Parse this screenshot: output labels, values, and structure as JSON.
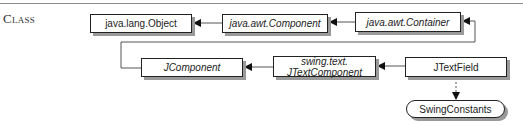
{
  "section_label": "Class",
  "classes": {
    "object": {
      "label": "java.lang.Object",
      "italic": false
    },
    "component": {
      "label": "java.awt.Component",
      "italic": true
    },
    "container": {
      "label": "java.awt.Container",
      "italic": true
    },
    "jcomponent": {
      "label": "JComponent",
      "italic": true
    },
    "jtextcomponent": {
      "line1": "swing.text.",
      "line2": "JTextComponent",
      "italic": true
    },
    "jtextfield": {
      "label": "JTextField",
      "italic": false
    },
    "swingconstants": {
      "label": "SwingConstants",
      "kind": "interface"
    }
  },
  "relations": [
    {
      "from": "java.awt.Component",
      "to": "java.lang.Object",
      "type": "extends"
    },
    {
      "from": "java.awt.Container",
      "to": "java.awt.Component",
      "type": "extends"
    },
    {
      "from": "JComponent",
      "to": "java.awt.Container",
      "type": "extends"
    },
    {
      "from": "swing.text.JTextComponent",
      "to": "JComponent",
      "type": "extends"
    },
    {
      "from": "JTextField",
      "to": "swing.text.JTextComponent",
      "type": "extends"
    },
    {
      "from": "JTextField",
      "to": "SwingConstants",
      "type": "implements"
    }
  ],
  "colors": {
    "line": "#555555",
    "border": "#222222",
    "shadow": "#9a9a9a"
  }
}
